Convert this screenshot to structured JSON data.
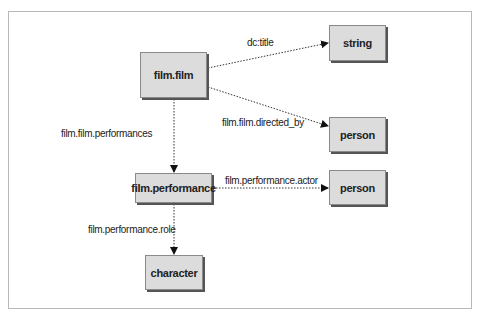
{
  "diagram": {
    "nodes": {
      "film_film": "film.film",
      "string": "string",
      "person_director": "person",
      "film_performance": "film.performance",
      "person_actor": "person",
      "character": "character"
    },
    "edges": {
      "dc_title": "dc:title",
      "directed_by": "film.film.directed_by",
      "performances": "film.film.performances",
      "actor": "film.performance.actor",
      "role": "film.performance.role"
    },
    "colors": {
      "node_fill": "#dcdcdc",
      "node_shadow": "#555555",
      "edge": "#333333",
      "frame": "#b8b8b8"
    }
  }
}
